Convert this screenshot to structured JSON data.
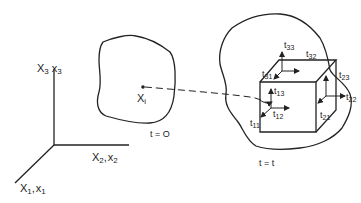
{
  "axes": {
    "x3_label": "X",
    "x3_sub": "3",
    "x3_small": "x",
    "x3_small_sub": "3",
    "x2_label": "X",
    "x2_sub": "2",
    "x2_small": "x",
    "x2_small_sub": "2",
    "x1_label": "X",
    "x1_sub": "1",
    "x1_small": "x",
    "x1_small_sub": "1",
    "sep": ","
  },
  "initial_body": {
    "point_label": "X",
    "point_sub": "i",
    "time_label": "t = O"
  },
  "deformed_body": {
    "time_label": "t = t",
    "stresses": [
      {
        "label": "t",
        "sub": "33"
      },
      {
        "label": "t",
        "sub": "32"
      },
      {
        "label": "t",
        "sub": "31"
      },
      {
        "label": "t",
        "sub": "23"
      },
      {
        "label": "t",
        "sub": "22"
      },
      {
        "label": "t",
        "sub": "21"
      },
      {
        "label": "t",
        "sub": "13"
      },
      {
        "label": "t",
        "sub": "12"
      },
      {
        "label": "t",
        "sub": "11"
      }
    ]
  }
}
